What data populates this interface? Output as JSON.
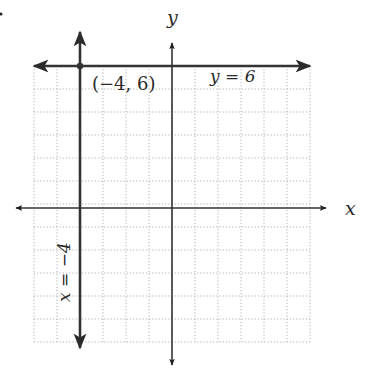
{
  "chart_data": {
    "type": "line",
    "title": "",
    "xlabel": "x",
    "ylabel": "y",
    "xlim": [
      -6,
      6
    ],
    "ylim": [
      -6,
      6
    ],
    "grid": true,
    "grid_style": "dotted",
    "series": [
      {
        "name": "y = 6",
        "kind": "horizontal",
        "value": 6
      },
      {
        "name": "x = −4",
        "kind": "vertical",
        "value": -4
      }
    ],
    "points": [
      {
        "x": -4,
        "y": 6,
        "label": "(−4, 6)"
      }
    ]
  },
  "labels": {
    "x_axis": "x",
    "y_axis": "y",
    "point": "(−4, 6)",
    "horizontal_line": "y = 6",
    "vertical_line": "x = −4"
  },
  "marker": "."
}
